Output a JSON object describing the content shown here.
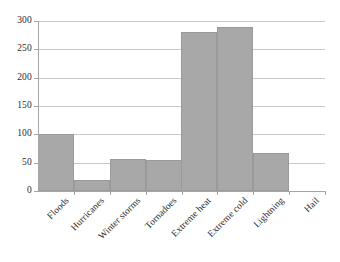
{
  "chart_data": {
    "type": "bar",
    "title": "",
    "subtitle": "",
    "xlabel": "",
    "ylabel": "",
    "categories": [
      "Floods",
      "Hurricanes",
      "Winter storms",
      "Tornadoes",
      "Extreme heat",
      "Extreme cold",
      "Lightning",
      "Hail"
    ],
    "values": [
      100,
      20,
      56,
      55,
      281,
      290,
      67,
      0
    ],
    "ylim": [
      0,
      300
    ],
    "yticks": [
      0,
      50,
      100,
      150,
      200,
      250,
      300
    ],
    "ytick_labels": [
      "0",
      "50",
      "100",
      "150",
      "200",
      "250",
      "300"
    ],
    "grid": true,
    "grid_axis": "y",
    "legend": false,
    "legend_position": "none",
    "bar_color": "#a8a8a8",
    "bar_edge_color": "#9a9a9a",
    "gridline_color": "#c9c9c9",
    "axis_color": "#a6a6a6",
    "text_color": "#2b2b2b",
    "xtick_label_rotation": -45
  }
}
